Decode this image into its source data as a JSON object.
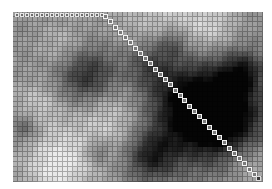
{
  "figure": {
    "kind": "grayscale grid heatmap with square marker path",
    "background": "#ffffff",
    "grid": {
      "left": 13,
      "top": 12,
      "cols": 50,
      "rows": 34,
      "cell": 5,
      "base_gray": 150,
      "line_color": "rgba(0,0,0,0.28)"
    },
    "blobs": [
      {
        "cx": 0.3,
        "cy": 0.38,
        "r": 0.12,
        "d": -110
      },
      {
        "cx": 0.55,
        "cy": 0.3,
        "r": 0.1,
        "d": -70
      },
      {
        "cx": 0.72,
        "cy": 0.55,
        "r": 0.22,
        "d": -150
      },
      {
        "cx": 0.84,
        "cy": 0.62,
        "r": 0.16,
        "d": -120
      },
      {
        "cx": 0.92,
        "cy": 0.35,
        "r": 0.08,
        "d": -90
      },
      {
        "cx": 0.64,
        "cy": 0.18,
        "r": 0.06,
        "d": -60
      },
      {
        "cx": 0.55,
        "cy": 0.85,
        "r": 0.1,
        "d": -100
      },
      {
        "cx": 0.18,
        "cy": 0.9,
        "r": 0.14,
        "d": 90
      },
      {
        "cx": 0.4,
        "cy": 0.62,
        "r": 0.16,
        "d": 70
      },
      {
        "cx": 0.1,
        "cy": 0.55,
        "r": 0.1,
        "d": 50
      },
      {
        "cx": 0.05,
        "cy": 0.68,
        "r": 0.06,
        "d": -60
      },
      {
        "cx": 0.34,
        "cy": 0.82,
        "r": 0.05,
        "d": -60
      },
      {
        "cx": 0.62,
        "cy": 0.08,
        "r": 0.2,
        "d": 60
      },
      {
        "cx": 0.8,
        "cy": 0.1,
        "r": 0.1,
        "d": 50
      },
      {
        "cx": 0.95,
        "cy": 0.9,
        "r": 0.1,
        "d": 40
      },
      {
        "cx": 0.2,
        "cy": 0.2,
        "r": 0.1,
        "d": 40
      }
    ],
    "markers": {
      "top_row": {
        "x0": 15,
        "y": 13,
        "step": 5,
        "count": 18,
        "size": 4
      },
      "diagonal": {
        "x0": 103,
        "y0": 14,
        "x1": 252,
        "y1": 172,
        "count": 31,
        "size": 5
      },
      "end": {
        "x": 256,
        "y": 176,
        "size": 5
      }
    }
  }
}
